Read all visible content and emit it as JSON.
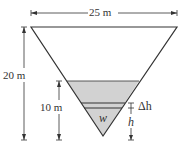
{
  "diagram": {
    "top_width_label": "25 m",
    "height_label": "20 m",
    "water_depth_label": "10 m",
    "strip_thickness_label": "Δh",
    "strip_height_label": "h",
    "weight_label": "w",
    "colors": {
      "water": "#d2d2d2",
      "line": "#333333"
    }
  }
}
